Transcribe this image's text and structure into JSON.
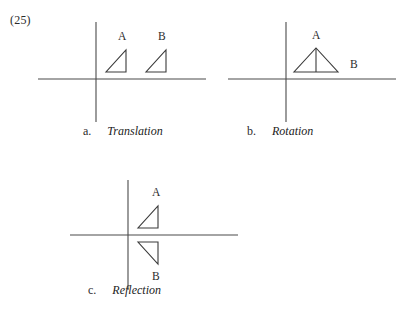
{
  "question": {
    "number": "(25)"
  },
  "colors": {
    "axis": "#4a4a4a",
    "shape": "#3a3a3a",
    "text": "#2b2b2b",
    "background": "#ffffff"
  },
  "figures": [
    {
      "key": "a",
      "caption_letter": "a.",
      "caption_name": "Translation",
      "axis": {
        "x_from": 0,
        "x_to": 168,
        "y_axis_at": 58,
        "x_axis_at": 57,
        "y_from": 0,
        "y_to": 100
      },
      "shapes": [
        {
          "label": "A",
          "label_x": 80,
          "label_y": 18,
          "points": "68,50 88,50 88,28",
          "description": "right-triangle-right-angle-bottom-right"
        },
        {
          "label": "B",
          "label_x": 120,
          "label_y": 18,
          "points": "108,50 128,50 128,28",
          "description": "right-triangle-right-angle-bottom-right"
        }
      ],
      "interior_lines": []
    },
    {
      "key": "b",
      "caption_letter": "b.",
      "caption_name": "Rotation",
      "axis": {
        "x_from": 0,
        "x_to": 168,
        "y_axis_at": 58,
        "x_axis_at": 57,
        "y_from": 0,
        "y_to": 100
      },
      "shapes": [
        {
          "label": "A",
          "label_x": 84,
          "label_y": 17,
          "points": "66,50 110,50 88,26",
          "description": "isosceles-triangle-apex-up"
        }
      ],
      "interior_lines": [
        {
          "x1": 88,
          "y1": 26,
          "x2": 88,
          "y2": 50
        }
      ],
      "extra_labels": [
        {
          "label": "B",
          "label_x": 122,
          "label_y": 46
        }
      ]
    },
    {
      "key": "c",
      "caption_letter": "c.",
      "caption_name": "Reflection",
      "axis": {
        "x_from": 0,
        "x_to": 168,
        "y_axis_at": 58,
        "x_axis_at": 55,
        "y_from": 0,
        "y_to": 110
      },
      "shapes": [
        {
          "label": "A",
          "label_x": 82,
          "label_y": 16,
          "points": "68,48 88,48 88,26",
          "description": "right-triangle-right-angle-bottom-right"
        },
        {
          "label": "B",
          "label_x": 82,
          "label_y": 100,
          "points": "68,62 88,62 88,84",
          "description": "right-triangle-right-angle-top-right-mirrored"
        }
      ],
      "interior_lines": []
    }
  ]
}
